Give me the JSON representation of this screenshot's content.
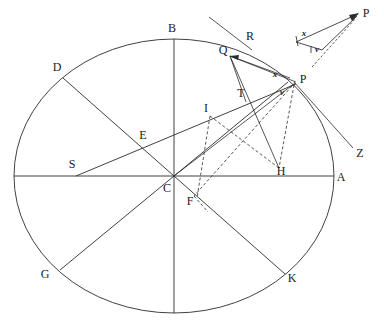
{
  "figure": {
    "background_color": "#ffffff",
    "line_color": "#2b2b2b",
    "width": 384,
    "height": 323
  },
  "circle": {
    "center_label": "C",
    "cx": 174,
    "cy": 176,
    "rx": 160,
    "ry": 137
  },
  "point_labels": [
    {
      "name": "A",
      "text": "A",
      "x": 341,
      "y": 181,
      "on_circle": true
    },
    {
      "name": "B",
      "text": "B",
      "x": 172,
      "y": 32,
      "on_circle": true
    },
    {
      "name": "D",
      "text": "D",
      "x": 57,
      "y": 71,
      "on_circle": true
    },
    {
      "name": "G",
      "text": "G",
      "x": 45,
      "y": 278,
      "on_circle": true
    },
    {
      "name": "K",
      "text": "K",
      "x": 290,
      "y": 281,
      "on_circle": true
    },
    {
      "name": "Q",
      "text": "Q",
      "x": 224,
      "y": 53,
      "on_circle": true
    },
    {
      "name": "R",
      "text": "R",
      "x": 249,
      "y": 40,
      "on_circle": false
    },
    {
      "name": "P",
      "text": "P",
      "x": 300,
      "y": 82,
      "on_circle": true
    },
    {
      "name": "Z",
      "text": "Z",
      "x": 359,
      "y": 156,
      "on_circle": false
    },
    {
      "name": "T",
      "text": "T",
      "x": 241,
      "y": 96,
      "on_circle": false
    },
    {
      "name": "I",
      "text": "I",
      "x": 206,
      "y": 112,
      "on_circle": false
    },
    {
      "name": "E",
      "text": "E",
      "x": 143,
      "y": 138,
      "on_circle": false
    },
    {
      "name": "S",
      "text": "S",
      "x": 72,
      "y": 167,
      "on_circle": false
    },
    {
      "name": "C",
      "text": "C",
      "x": 167,
      "y": 191,
      "on_circle": false
    },
    {
      "name": "F",
      "text": "F",
      "x": 189,
      "y": 203,
      "on_circle": false
    },
    {
      "name": "H",
      "text": "H",
      "x": 279,
      "y": 174,
      "on_circle": false
    },
    {
      "name": "P-inset",
      "text": "P",
      "x": 365,
      "y": 16,
      "on_circle": false
    }
  ],
  "variable_labels": [
    {
      "name": "x-main",
      "text": "x",
      "x": 275,
      "y": 76
    },
    {
      "name": "v-main",
      "text": "v",
      "x": 281,
      "y": 94
    },
    {
      "name": "x-inset",
      "text": "x",
      "x": 305,
      "y": 35
    },
    {
      "name": "v-inset",
      "text": "v",
      "x": 318,
      "y": 51
    }
  ],
  "chords_and_rays": [
    {
      "name": "diameter-horizontal-A",
      "from": "left-edge",
      "to": "A"
    },
    {
      "name": "diameter-vertical-B",
      "from": "B",
      "to": "bottom-edge"
    },
    {
      "name": "diameter-D-K",
      "from": "D",
      "to": "K"
    },
    {
      "name": "diameter-G-B-right",
      "from": "G",
      "to": "upper-right"
    },
    {
      "name": "chord-S-to-P",
      "from": "S",
      "to": "P"
    },
    {
      "name": "segment-Q-to-P",
      "from": "Q",
      "to": "P"
    },
    {
      "name": "segment-Q-to-T",
      "from": "Q",
      "to": "T"
    },
    {
      "name": "segment-Q-to-H",
      "from": "Q",
      "to": "H"
    },
    {
      "name": "segment-Q-to-C",
      "from": "Q",
      "to": "C"
    },
    {
      "name": "tangent-line-at-Q-through-R",
      "from": "tangent-start",
      "to": "R"
    },
    {
      "name": "ray-P-to-Z",
      "from": "P",
      "to": "Z"
    },
    {
      "name": "segment-C-to-P",
      "from": "C",
      "to": "P"
    },
    {
      "name": "dashed-P-to-H",
      "from": "P",
      "to": "H",
      "style": "dashed"
    },
    {
      "name": "dashed-P-to-F",
      "from": "P",
      "to": "F",
      "style": "dashed"
    },
    {
      "name": "dashed-I-to-H",
      "from": "I",
      "to": "H",
      "style": "dashed"
    },
    {
      "name": "dashed-I-to-F",
      "from": "I",
      "to": "F",
      "style": "dashed"
    }
  ],
  "inset": {
    "name": "velocity-triangle-inset",
    "apex_label": "P",
    "side_labels": [
      "x",
      "v"
    ]
  }
}
